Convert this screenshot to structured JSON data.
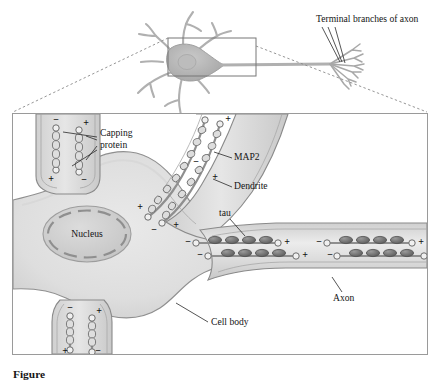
{
  "figure": {
    "caption_prefix": "Figure",
    "caption_number": "",
    "caption_text": "",
    "width": 442,
    "height": 380
  },
  "colors": {
    "cytoplasm_light": "#e3e3e3",
    "cytoplasm_mid": "#d2d2d2",
    "cytoplasm_dark": "#bdbdbd",
    "membrane_line": "#8a8a8a",
    "nucleus_fill": "#cfcfcf",
    "nucleus_edge": "#9a9a9a",
    "microtubule": "#8f8f8f",
    "tau_fill": "#6f6f6f",
    "map2_fill": "#d8d8d8",
    "frame_line": "#9a9a9a",
    "dashed_line": "#8a8a8a",
    "leader_line": "#2a2a2a",
    "text": "#141414",
    "overview_neuron": "#b5b5b5"
  },
  "overview": {
    "label_terminal": "Terminal branches of axon",
    "inset_box": {
      "x": 168,
      "y": 38,
      "w": 88,
      "h": 38
    }
  },
  "detail": {
    "frame": {
      "x": 12,
      "y": 113,
      "w": 416,
      "h": 242
    },
    "labels": {
      "capping_line1": "Capping",
      "capping_line2": "protein",
      "map2": "MAP2",
      "dendrite": "Dendrite",
      "tau": "tau",
      "nucleus": "Nucleus",
      "axon": "Axon",
      "cell_body": "Cell body"
    }
  },
  "polarity": {
    "plus": "+",
    "minus": "−"
  },
  "microtubules": {
    "dendrite_top_left": [
      {
        "id": "mt-tl-1",
        "top_sign": "−",
        "bottom_sign": "+",
        "beads": "capping-protein"
      },
      {
        "id": "mt-tl-2",
        "top_sign": "+",
        "bottom_sign": "−",
        "beads": "capping-protein"
      }
    ],
    "dendrite_top_right": [
      {
        "id": "mt-tr-1",
        "distal_sign": "+",
        "proximal_sign": "−",
        "beads": "MAP2"
      },
      {
        "id": "mt-tr-2",
        "distal_sign": "−",
        "proximal_sign": "+",
        "beads": "MAP2"
      }
    ],
    "dendrite_bottom_left": [
      {
        "id": "mt-bl-1",
        "top_sign": "−",
        "bottom_sign": "+",
        "beads": "capping-protein"
      },
      {
        "id": "mt-bl-2",
        "top_sign": "+",
        "bottom_sign": "−",
        "beads": "capping-protein"
      }
    ],
    "axon": [
      {
        "id": "mt-ax-1",
        "left_sign": "−",
        "right_sign": "+",
        "beads": "tau",
        "bead_count": 4
      },
      {
        "id": "mt-ax-2",
        "left_sign": "−",
        "right_sign": "+",
        "beads": "tau",
        "bead_count": 4
      },
      {
        "id": "mt-ax-3",
        "left_sign": "−",
        "right_sign": "+",
        "beads": "tau",
        "bead_count": 4
      },
      {
        "id": "mt-ax-4",
        "left_sign": "−",
        "right_sign": "+",
        "beads": "tau",
        "bead_count": 4
      }
    ]
  }
}
